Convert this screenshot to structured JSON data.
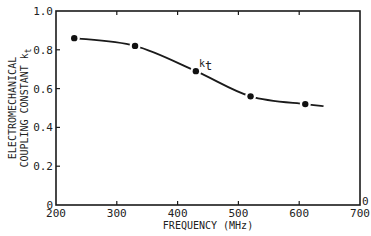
{
  "chart_data": {
    "type": "line",
    "title": "",
    "xlabel": "FREQUENCY (MHz)",
    "ylabel_line1": "ELECTROMECHANICAL",
    "ylabel_line2": "COUPLING CONSTANT k",
    "ylabel_sub": "t",
    "xlim": [
      200,
      700
    ],
    "ylim": [
      0,
      1.0
    ],
    "x_ticks": [
      200,
      300,
      400,
      500,
      600,
      700
    ],
    "x_tick_labels": [
      "200",
      "300",
      "400",
      "500",
      "600",
      "700"
    ],
    "y_ticks": [
      0,
      0.2,
      0.4,
      0.6,
      0.8,
      1.0
    ],
    "y_tick_labels": [
      "0",
      "0.2",
      "0.4",
      "0.6",
      "0.8",
      "1.0"
    ],
    "right_axis_label": "0",
    "grid": false,
    "legend": null,
    "series": [
      {
        "name": "kt",
        "x": [
          230,
          330,
          430,
          520,
          610
        ],
        "values": [
          0.86,
          0.82,
          0.69,
          0.56,
          0.52
        ],
        "curve_extends_to": [
          640,
          0.51
        ]
      }
    ],
    "annotations": [
      {
        "text": "k",
        "sub": "t",
        "x": 435,
        "y": 0.71
      }
    ]
  }
}
